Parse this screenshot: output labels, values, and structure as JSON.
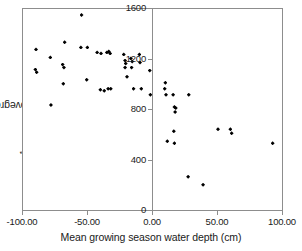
{
  "chart_data": {
    "type": "scatter",
    "title": "",
    "xlabel": "Mean growing season water depth (cm)",
    "ylabel": "Aboveground NPP (g m−2 yr−1)",
    "ylabel_parts": {
      "prefix": "Aboveground NPP (g m",
      "sup1": "−2",
      "mid": " yr",
      "sup2": "−1",
      "suffix": ")"
    },
    "xlim": [
      -100,
      100
    ],
    "ylim": [
      0,
      1600
    ],
    "xticks": [
      -100,
      -50,
      0,
      50,
      100
    ],
    "xtick_labels": [
      "-100.00",
      "-50.00",
      "0.00",
      "50.00",
      "100.00"
    ],
    "yticks": [
      0,
      400,
      800,
      1200,
      1600
    ],
    "ytick_labels": [
      "0",
      "400",
      "800",
      "1200",
      "1600"
    ],
    "grid": false,
    "legend": null,
    "marker": "diamond",
    "marker_color": "#000000",
    "yaxis_position": "x=0",
    "points": [
      {
        "x": -90.0,
        "y": 1280
      },
      {
        "x": -90.5,
        "y": 1120
      },
      {
        "x": -89.5,
        "y": 1100
      },
      {
        "x": -79.0,
        "y": 1216
      },
      {
        "x": -78.5,
        "y": 840
      },
      {
        "x": -68.0,
        "y": 1336
      },
      {
        "x": -69.5,
        "y": 1160
      },
      {
        "x": -68.5,
        "y": 1136
      },
      {
        "x": -69.0,
        "y": 1008
      },
      {
        "x": -55.0,
        "y": 1552
      },
      {
        "x": -55.5,
        "y": 1296
      },
      {
        "x": -50.5,
        "y": 1296
      },
      {
        "x": -51.0,
        "y": 1040
      },
      {
        "x": -43.0,
        "y": 1256
      },
      {
        "x": -40.0,
        "y": 1248
      },
      {
        "x": -40.5,
        "y": 960
      },
      {
        "x": -37.5,
        "y": 952
      },
      {
        "x": -35.5,
        "y": 1256
      },
      {
        "x": -34.0,
        "y": 1264
      },
      {
        "x": -33.0,
        "y": 1248
      },
      {
        "x": -34.5,
        "y": 968
      },
      {
        "x": -32.5,
        "y": 968
      },
      {
        "x": -22.5,
        "y": 1240
      },
      {
        "x": -21.5,
        "y": 1192
      },
      {
        "x": -21.0,
        "y": 1168
      },
      {
        "x": -21.5,
        "y": 1136
      },
      {
        "x": -20.0,
        "y": 1064
      },
      {
        "x": -17.0,
        "y": 1208
      },
      {
        "x": -16.0,
        "y": 1184
      },
      {
        "x": -16.5,
        "y": 1136
      },
      {
        "x": -15.0,
        "y": 968
      },
      {
        "x": -10.5,
        "y": 1240
      },
      {
        "x": -10.0,
        "y": 1176
      },
      {
        "x": -9.0,
        "y": 968
      },
      {
        "x": -2.5,
        "y": 1112
      },
      {
        "x": -2.0,
        "y": 920
      },
      {
        "x": 9.5,
        "y": 1016
      },
      {
        "x": 9.0,
        "y": 968
      },
      {
        "x": 10.0,
        "y": 920
      },
      {
        "x": 11.0,
        "y": 552
      },
      {
        "x": 15.5,
        "y": 920
      },
      {
        "x": 16.5,
        "y": 824
      },
      {
        "x": 17.5,
        "y": 816
      },
      {
        "x": 17.0,
        "y": 784
      },
      {
        "x": 16.0,
        "y": 632
      },
      {
        "x": 16.5,
        "y": 536
      },
      {
        "x": 27.5,
        "y": 920
      },
      {
        "x": 27.0,
        "y": 272
      },
      {
        "x": 38.5,
        "y": 208
      },
      {
        "x": 50.0,
        "y": 648
      },
      {
        "x": 59.5,
        "y": 648
      },
      {
        "x": 60.5,
        "y": 616
      },
      {
        "x": 92.0,
        "y": 536
      }
    ]
  }
}
